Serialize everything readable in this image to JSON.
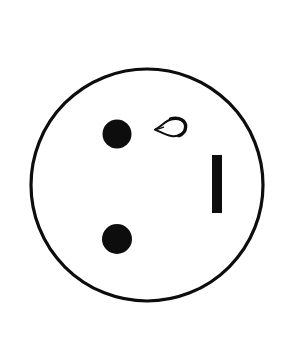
{
  "figure": {
    "title": "Line drawing of a circle containing two filled dots, a teardrop outline and a vertical bar",
    "background_color": "#ffffff",
    "ink_color": "#0d0d0d",
    "canvas": {
      "width": 281,
      "height": 340
    },
    "shapes": [
      {
        "name": "outer-circle",
        "kind": "circle-outline",
        "cx": 147,
        "cy": 185,
        "r": 116,
        "stroke_width": 3.2,
        "fill": "none",
        "stroke": "#0d0d0d"
      },
      {
        "name": "upper-left-dot",
        "kind": "filled-ellipse",
        "cx": 117,
        "cy": 134,
        "rx": 14.5,
        "ry": 14.5,
        "fill": "#0d0d0d"
      },
      {
        "name": "lower-left-dot",
        "kind": "filled-ellipse",
        "cx": 117,
        "cy": 239,
        "rx": 15,
        "ry": 15,
        "fill": "#0d0d0d"
      },
      {
        "name": "teardrop-outline",
        "kind": "teardrop-outline",
        "tip_x": 155,
        "tip_y": 129,
        "bulb_cx": 176,
        "bulb_cy": 127,
        "bulb_rx": 10,
        "bulb_ry": 8.5,
        "stroke": "#0d0d0d",
        "fill": "none"
      },
      {
        "name": "vertical-bar",
        "kind": "filled-rect",
        "x": 212,
        "y": 155,
        "width": 10,
        "height": 58,
        "fill": "#0d0d0d"
      }
    ]
  }
}
